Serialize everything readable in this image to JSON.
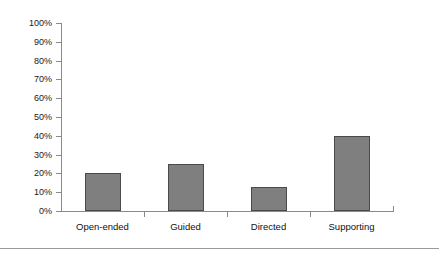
{
  "chart_data": {
    "type": "bar",
    "title": "",
    "subtitle": "",
    "xlabel": "",
    "ylabel": "",
    "categories": [
      "Open-ended",
      "Guided",
      "Directed",
      "Supporting"
    ],
    "values": [
      20,
      25,
      13,
      40
    ],
    "value_suffix": "%",
    "ylim": [
      0,
      100
    ],
    "ytick_labels": [
      "100%",
      "90%",
      "80%",
      "70%",
      "60%",
      "50%",
      "40%",
      "30%",
      "20%",
      "10%",
      "0%"
    ],
    "ytick_values": [
      100,
      90,
      80,
      70,
      60,
      50,
      40,
      30,
      20,
      10,
      0
    ],
    "ytick_step": 10,
    "grid": false,
    "legend": null,
    "legend_position": "none",
    "series": [
      {
        "name": "",
        "values": [
          20,
          25,
          13,
          40
        ]
      }
    ],
    "colors": {
      "bar_fill": "#7f7f7f",
      "bar_stroke": "#4a4a4a",
      "axis": "#8a8a8a",
      "text": "#111111",
      "background": "#ffffff",
      "rule": "#9a9a9a"
    }
  }
}
